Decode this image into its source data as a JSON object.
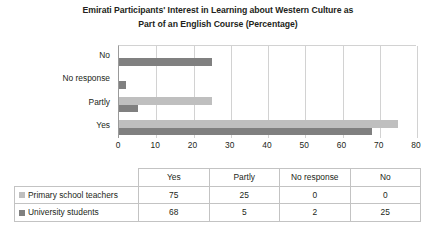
{
  "chart_data": {
    "type": "bar",
    "orientation": "horizontal",
    "title": "Emirati Participants' Interest in Learning about Western Culture as Part of an English Course (Percentage)",
    "title_lines": [
      "Emirati Participants' Interest in Learning about Western Culture as",
      "Part of an English Course (Percentage)"
    ],
    "xlabel": "",
    "ylabel": "",
    "categories": [
      "Yes",
      "Partly",
      "No response",
      "No"
    ],
    "categories_display_order": [
      "No",
      "No response",
      "Partly",
      "Yes"
    ],
    "series": [
      {
        "name": "Primary school teachers",
        "color": "#bfbfbf",
        "values": [
          75,
          25,
          0,
          0
        ]
      },
      {
        "name": "University students",
        "color": "#808080",
        "values": [
          68,
          5,
          2,
          25
        ]
      }
    ],
    "xlim": [
      0,
      80
    ],
    "xticks": [
      0,
      10,
      20,
      30,
      40,
      50,
      60,
      70,
      80
    ],
    "xtick_labels": [
      "0",
      "10",
      "20",
      "30",
      "40",
      "50",
      "60",
      "70",
      "80"
    ],
    "grid": true,
    "grid_axis": "x",
    "legend_position": "table",
    "value_unit": "percentage"
  },
  "table": {
    "corner_label": "",
    "headers": [
      "Yes",
      "Partly",
      "No response",
      "No"
    ],
    "rows": [
      {
        "label": "Primary school teachers",
        "swatch_color": "#bfbfbf",
        "values": [
          "75",
          "25",
          "0",
          "0"
        ]
      },
      {
        "label": "University students",
        "swatch_color": "#808080",
        "values": [
          "68",
          "5",
          "2",
          "25"
        ]
      }
    ]
  }
}
